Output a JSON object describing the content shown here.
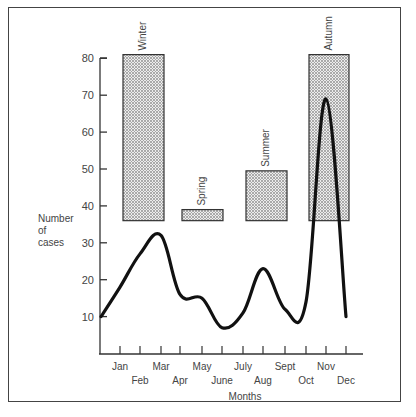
{
  "chart_data": {
    "type": "line",
    "title": "",
    "xlabel": "Months",
    "ylabel": "Number of cases",
    "ylabel_lines": [
      "Number",
      "of",
      "cases"
    ],
    "ylim": [
      0,
      80
    ],
    "yticks": [
      10,
      20,
      30,
      40,
      50,
      60,
      70,
      80
    ],
    "categories": [
      "Jan",
      "Feb",
      "Mar",
      "Apr",
      "May",
      "June",
      "July",
      "Aug",
      "Sept",
      "Oct",
      "Nov",
      "Dec"
    ],
    "grid": false,
    "legend": null,
    "series": [
      {
        "name": "Number of cases",
        "style": "smooth-line",
        "points": [
          {
            "x": "start",
            "y": 10
          },
          {
            "x": "Jan",
            "y": 18
          },
          {
            "x": "Feb",
            "y": 27
          },
          {
            "x": "Mar",
            "y": 32
          },
          {
            "x": "Apr",
            "y": 16
          },
          {
            "x": "May",
            "y": 15
          },
          {
            "x": "June",
            "y": 7
          },
          {
            "x": "July",
            "y": 11
          },
          {
            "x": "Aug",
            "y": 23
          },
          {
            "x": "Sept",
            "y": 12
          },
          {
            "x": "Oct",
            "y": 14
          },
          {
            "x": "Nov",
            "y": 69
          },
          {
            "x": "Dec",
            "y": 10
          }
        ]
      }
    ],
    "seasonal_bars": [
      {
        "label": "Winter",
        "x_start": "Jan",
        "x_end": "Mar",
        "y_bottom": 36,
        "y_top": 81
      },
      {
        "label": "Spring",
        "x_start": "Apr",
        "x_end": "June",
        "y_bottom": 36,
        "y_top": 39
      },
      {
        "label": "Summer",
        "x_start": "July",
        "x_end": "Sept",
        "y_bottom": 36,
        "y_top": 49.5
      },
      {
        "label": "Autumn",
        "x_start": "Oct",
        "x_end": "Dec",
        "y_bottom": 36,
        "y_top": 81
      }
    ],
    "colors": {
      "line": "#111111",
      "bar_fill": "#d9d9d9",
      "bar_stroke": "#333333",
      "axis": "#333333",
      "frame": "#444444"
    }
  }
}
